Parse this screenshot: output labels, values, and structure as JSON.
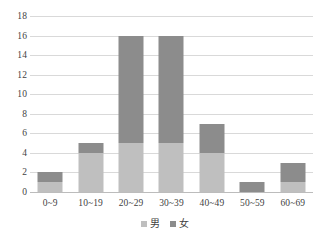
{
  "chart_data": {
    "type": "bar",
    "stacked": true,
    "title": "",
    "subtitle": "",
    "xlabel": "",
    "ylabel": "",
    "categories": [
      "0~9",
      "10~19",
      "20~29",
      "30~39",
      "40~49",
      "50~59",
      "60~69"
    ],
    "series": [
      {
        "name": "男",
        "color": "#bfbfbf",
        "values": [
          1,
          4,
          5,
          5,
          4,
          0,
          1
        ]
      },
      {
        "name": "女",
        "color": "#8c8c8c",
        "values": [
          1,
          1,
          11,
          11,
          3,
          1,
          2
        ]
      }
    ],
    "totals": [
      2,
      5,
      16,
      16,
      7,
      1,
      3
    ],
    "ylim": [
      0,
      18
    ],
    "ytick_step": 2,
    "yticks": [
      "0",
      "2",
      "4",
      "6",
      "8",
      "10",
      "12",
      "14",
      "16",
      "18"
    ],
    "grid": "horizontal",
    "legend_position": "bottom-center",
    "legend": [
      "男",
      "女"
    ]
  }
}
